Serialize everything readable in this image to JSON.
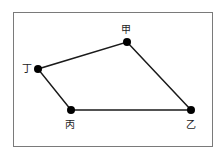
{
  "diagram": {
    "type": "quadrilateral",
    "points": [
      {
        "id": "jia",
        "label": "甲",
        "x": 127,
        "y": 42
      },
      {
        "id": "yi",
        "label": "乙",
        "x": 191,
        "y": 110
      },
      {
        "id": "bing",
        "label": "丙",
        "x": 71,
        "y": 110
      },
      {
        "id": "ding",
        "label": "丁",
        "x": 38,
        "y": 69
      }
    ],
    "edges": [
      [
        "jia",
        "yi"
      ],
      [
        "yi",
        "bing"
      ],
      [
        "bing",
        "ding"
      ],
      [
        "ding",
        "jia"
      ]
    ],
    "colors": {
      "line": "#1a1a1a",
      "point": "#000000",
      "frame": "#7a7a7a"
    }
  }
}
